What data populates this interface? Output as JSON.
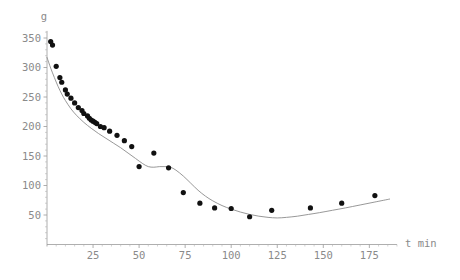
{
  "chart_data": {
    "type": "scatter",
    "title": "",
    "subtitle": "",
    "xlabel": "t min",
    "ylabel": "g",
    "xlim": [
      0,
      190
    ],
    "ylim": [
      0,
      370
    ],
    "grid": false,
    "legend": "none",
    "x_ticks": [
      25,
      50,
      75,
      100,
      125,
      150,
      175
    ],
    "y_ticks": [
      50,
      100,
      150,
      200,
      250,
      300,
      350
    ],
    "x_tick_labels": [
      "25",
      "50",
      "75",
      "100",
      "125",
      "150",
      "175"
    ],
    "y_tick_labels": [
      "50",
      "100",
      "150",
      "200",
      "250",
      "300",
      "350"
    ],
    "point_color": "#111111",
    "curve_color": "#8c8c8c",
    "axis_color": "#9a9a9a",
    "background_color": "#ffffff",
    "series": [
      {
        "name": "data",
        "marker": "filled-circle",
        "x": [
          2,
          3,
          5,
          7,
          8,
          10,
          11,
          13,
          15,
          17,
          19,
          20,
          22,
          23,
          24,
          25,
          26,
          27,
          29,
          31,
          34,
          38,
          42,
          46,
          50,
          58,
          66,
          74,
          83,
          91,
          100,
          110,
          122,
          143,
          160,
          178
        ],
        "y": [
          344,
          338,
          302,
          283,
          275,
          262,
          255,
          248,
          240,
          232,
          227,
          222,
          218,
          214,
          211,
          209,
          207,
          205,
          200,
          198,
          192,
          185,
          176,
          166,
          132,
          155,
          130,
          88,
          70,
          62,
          61,
          47,
          58,
          62,
          70,
          83
        ]
      }
    ],
    "fit_curve": {
      "name": "fitted curve",
      "x": [
        0,
        2,
        4,
        6,
        8,
        10,
        13,
        16,
        20,
        24,
        28,
        32,
        36,
        40,
        44,
        48,
        52,
        55,
        58,
        61,
        64,
        67,
        70,
        74,
        78,
        82,
        86,
        90,
        95,
        100,
        105,
        110,
        115,
        120,
        125,
        130,
        136,
        142,
        148,
        155,
        162,
        170,
        178,
        186
      ],
      "y": [
        317,
        299,
        283,
        268,
        255,
        244,
        230,
        219,
        207,
        197,
        188,
        180,
        172,
        164,
        155,
        146,
        137,
        132,
        131,
        132,
        132,
        131,
        126,
        116,
        104,
        92,
        82,
        74,
        66,
        60,
        55,
        51,
        48,
        46,
        45,
        46,
        48,
        51,
        54,
        58,
        62,
        67,
        72,
        77
      ]
    }
  },
  "axis_titles": {
    "y": "g",
    "x": "t min"
  }
}
